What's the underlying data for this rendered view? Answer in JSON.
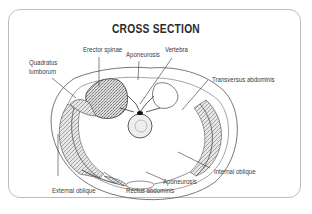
{
  "diagram": {
    "title": "CROSS SECTION",
    "labels": {
      "quadratus_line1": "Quadratus",
      "quadratus_line2": "lumborum",
      "erector_spinae": "Erector spinae",
      "aponeurosis_top": "Aponeurosis",
      "vertebra": "Vertebra",
      "transversus_abdominis": "Transversus abdominis",
      "internal_oblique": "Internal oblique",
      "aponeurosis_bottom": "Aponeurosis",
      "external_oblique": "External oblique",
      "rectus_abdominis": "Rectus abdominis"
    },
    "colors": {
      "frame": "#bdbdbd",
      "ink": "#3a3a3a",
      "muscle_fill": "#9a9a9a"
    }
  }
}
